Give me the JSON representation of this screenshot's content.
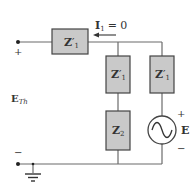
{
  "diagram": {
    "type": "circuit",
    "colors": {
      "wire": "#6b6b6b",
      "box_fill": "#c9c9c9",
      "box_stroke": "#444444",
      "text": "#333333"
    },
    "current_label": {
      "symbol": "I",
      "subscript": "1",
      "value": "= 0"
    },
    "terminals": {
      "top_sign": "+",
      "bottom_sign": "−",
      "voltage_label": "E",
      "voltage_subscript": "Th"
    },
    "components": [
      {
        "id": "Z1_series",
        "label": "Z",
        "prime": "′",
        "subscript": "1"
      },
      {
        "id": "Z1_mid",
        "label": "Z",
        "prime": "′",
        "subscript": "1"
      },
      {
        "id": "Z1_right",
        "label": "Z",
        "prime": "′",
        "subscript": "1"
      },
      {
        "id": "Z2",
        "label": "Z",
        "prime": "",
        "subscript": "2"
      }
    ],
    "source": {
      "label": "E",
      "plus": "+",
      "minus": "−"
    }
  }
}
